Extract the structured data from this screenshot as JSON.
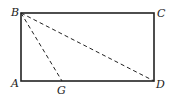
{
  "diagram": {
    "type": "geometry",
    "shape": "rectangle ABCD with dashed segments BG and BD",
    "points": {
      "A": {
        "label": "A",
        "x": 21,
        "y": 81
      },
      "B": {
        "label": "B",
        "x": 21,
        "y": 13
      },
      "C": {
        "label": "C",
        "x": 154,
        "y": 13
      },
      "D": {
        "label": "D",
        "x": 154,
        "y": 81
      },
      "G": {
        "label": "G",
        "x": 62,
        "y": 81
      }
    },
    "solid_segments": [
      "AB",
      "BC",
      "CD",
      "DA"
    ],
    "dashed_segments": [
      "BG",
      "BD"
    ],
    "colors": {
      "stroke": "#222222",
      "background": "#ffffff"
    }
  }
}
